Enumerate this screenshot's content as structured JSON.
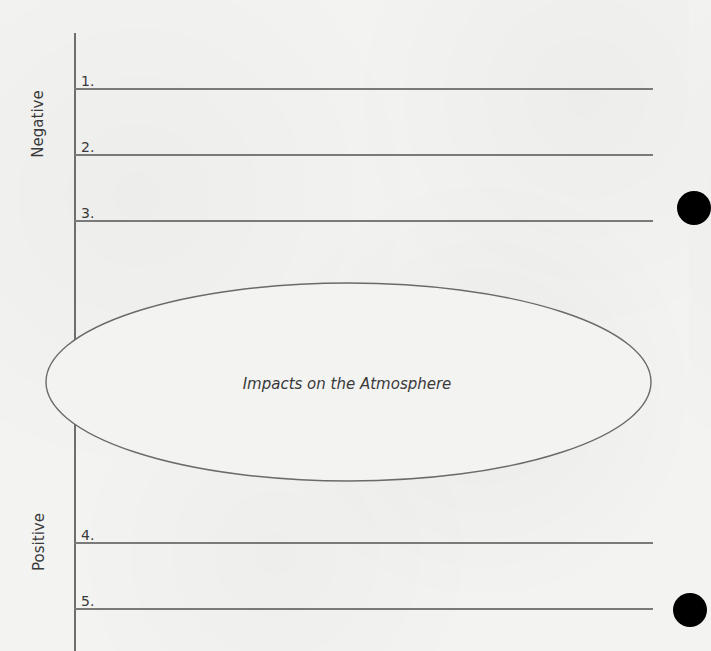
{
  "sections": {
    "negative": {
      "label": "Negative",
      "items": [
        {
          "number": "1."
        },
        {
          "number": "2."
        },
        {
          "number": "3."
        }
      ]
    },
    "positive": {
      "label": "Positive",
      "items": [
        {
          "number": "4."
        },
        {
          "number": "5."
        }
      ]
    }
  },
  "center": {
    "title": "Impacts on the Atmosphere"
  },
  "colors": {
    "paper": "#f3f3f2",
    "line": "#777777",
    "text": "#3a3a3a",
    "hole": "#000000"
  }
}
